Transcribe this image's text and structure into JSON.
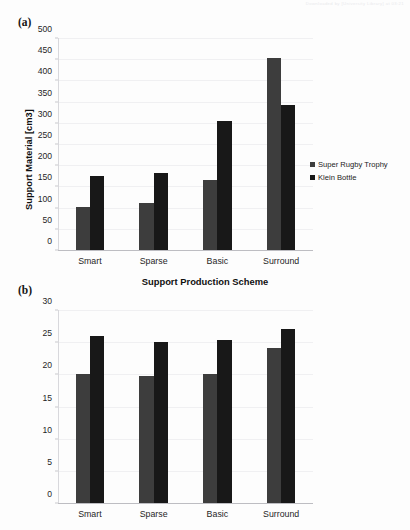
{
  "document": {
    "watermark": "Downloaded by [University Library] at 03:21"
  },
  "panels": [
    {
      "id": "a",
      "label": "(a)",
      "ylabel": "Support Material [cm3]",
      "xlabel": "Support Production Scheme"
    },
    {
      "id": "b",
      "label": "(b)",
      "ylabel": "Production Time [h]",
      "xlabel": ""
    }
  ],
  "legend": {
    "items": [
      {
        "label": "Super Rugby Trophy",
        "color": "#3d3d3d",
        "swatch": "legend-square-icon"
      },
      {
        "label": "Klein Bottle",
        "color": "#181818",
        "swatch": "legend-square-icon"
      }
    ]
  },
  "chart_data": [
    {
      "type": "bar",
      "panel": "a",
      "title": "",
      "categories": [
        "Smart",
        "Sparse",
        "Basic",
        "Surround"
      ],
      "series": [
        {
          "name": "Super Rugby Trophy",
          "color": "#3d3d3d",
          "values": [
            102,
            110,
            165,
            453
          ]
        },
        {
          "name": "Klein Bottle",
          "color": "#181818",
          "values": [
            175,
            182,
            305,
            342
          ]
        }
      ],
      "xlabel": "Support Production Scheme",
      "ylabel": "Support Material [cm3]",
      "ylim": [
        0,
        500
      ],
      "ytick_step": 50,
      "yticks": [
        0,
        50,
        100,
        150,
        200,
        250,
        300,
        350,
        400,
        450,
        500
      ],
      "grid": true,
      "legend_position": "right"
    },
    {
      "type": "bar",
      "panel": "b",
      "title": "",
      "categories": [
        "Smart",
        "Sparse",
        "Basic",
        "Surround"
      ],
      "series": [
        {
          "name": "Super Rugby Trophy",
          "color": "#3d3d3d",
          "values": [
            20.0,
            19.8,
            20.0,
            24.1
          ]
        },
        {
          "name": "Klein Bottle",
          "color": "#181818",
          "values": [
            26.0,
            25.1,
            25.3,
            27.1
          ]
        }
      ],
      "xlabel": "",
      "ylabel": "Production Time [h]",
      "ylim": [
        0,
        30
      ],
      "ytick_step": 5,
      "yticks": [
        0,
        5,
        10,
        15,
        20,
        25,
        30
      ],
      "grid": true,
      "legend_position": "right"
    }
  ]
}
